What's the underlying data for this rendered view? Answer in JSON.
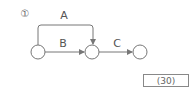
{
  "diagram": {
    "problem_number": "①",
    "nodes": [
      {
        "id": "n1",
        "cx": 38,
        "cy": 52,
        "r": 7
      },
      {
        "id": "n2",
        "cx": 92,
        "cy": 52,
        "r": 7
      },
      {
        "id": "n3",
        "cx": 140,
        "cy": 52,
        "r": 7
      }
    ],
    "edges": [
      {
        "label": "A",
        "from": "n1",
        "to": "n2",
        "route": "over-top"
      },
      {
        "label": "B",
        "from": "n1",
        "to": "n2",
        "route": "straight"
      },
      {
        "label": "C",
        "from": "n2",
        "to": "n3",
        "route": "straight"
      }
    ],
    "labels": {
      "a": "A",
      "b": "B",
      "c": "C"
    },
    "answer": "(30)",
    "colors": {
      "stroke": "#777777",
      "text": "#555555"
    }
  }
}
